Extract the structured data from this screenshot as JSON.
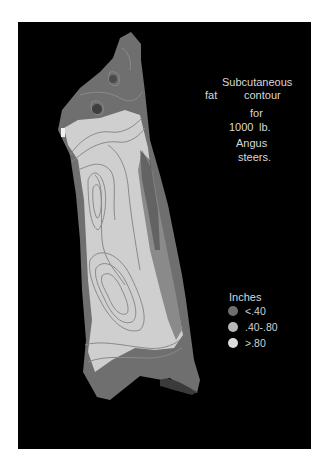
{
  "figure": {
    "title_lines": [
      "Subcutaneous",
      "fat",
      "contour",
      "for",
      "1000",
      "lb.",
      "Angus",
      "steers."
    ],
    "legend": {
      "title": "Inches",
      "items": [
        {
          "label": "<.40",
          "color": "#6e6e6e"
        },
        {
          "label": ".40-.80",
          "color": "#b8b8b8"
        },
        {
          "label": ">.80",
          "color": "#dcdcdc"
        }
      ]
    },
    "colors": {
      "background": "#000000",
      "page": "#ffffff",
      "thin_fat": "#6e6e6e",
      "medium_fat": "#a8a8a8",
      "thick_fat": "#d6d6d6",
      "contour_line": "#8a8a8a"
    }
  }
}
